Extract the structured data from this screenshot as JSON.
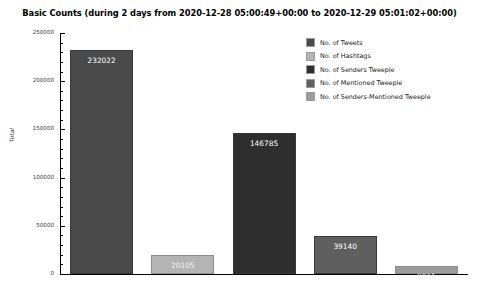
{
  "chart_data": {
    "type": "bar",
    "title": "Basic Counts (during 2 days from 2020-12-28 05:00:49+00:00 to 2020-12-29 05:01:02+00:00)",
    "xlabel": "",
    "ylabel": "Total",
    "ylim": [
      0,
      250000
    ],
    "grid": false,
    "legend_position": "top-right",
    "categories": [
      "No. of Tweets",
      "No. of Hashtags",
      "No. of Senders Tweeple",
      "No. of Mentioned Tweeple",
      "No. of Senders-Mentioned Tweeple"
    ],
    "values": [
      232022,
      20105,
      146785,
      39140,
      8011
    ],
    "value_labels": [
      "232022",
      "20105",
      "146785",
      "39140",
      "8011"
    ],
    "colors": [
      "#4a4a4a",
      "#b4b4b4",
      "#2e2e2e",
      "#5f5f5f",
      "#9c9c9c"
    ],
    "yticks": [
      0,
      50000,
      100000,
      150000,
      200000,
      250000
    ],
    "ytick_labels": [
      "0",
      "50000",
      "100000",
      "150000",
      "200000",
      "250000"
    ]
  },
  "legend": {
    "items": [
      {
        "label": "No. of Tweets",
        "color": "#4a4a4a"
      },
      {
        "label": "No. of Hashtags",
        "color": "#b4b4b4"
      },
      {
        "label": "No. of Senders Tweeple",
        "color": "#2e2e2e"
      },
      {
        "label": "No. of Mentioned Tweeple",
        "color": "#5f5f5f"
      },
      {
        "label": "No. of Senders-Mentioned Tweeple",
        "color": "#9c9c9c"
      }
    ]
  }
}
